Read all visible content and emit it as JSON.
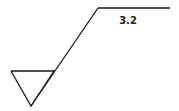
{
  "diagram": {
    "type": "surface-roughness-symbol",
    "roughness_value": "3.2",
    "stroke_color": "#1a1a1a",
    "background": "#ffffff"
  }
}
